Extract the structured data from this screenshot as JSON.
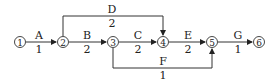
{
  "diagram": {
    "type": "activity-on-arrow network",
    "nodes": [
      {
        "id": "1",
        "label": "1",
        "x": 20,
        "y": 42
      },
      {
        "id": "2",
        "label": "2",
        "x": 63,
        "y": 42
      },
      {
        "id": "3",
        "label": "3",
        "x": 113,
        "y": 42
      },
      {
        "id": "4",
        "label": "4",
        "x": 163,
        "y": 42
      },
      {
        "id": "5",
        "label": "5",
        "x": 212,
        "y": 42
      },
      {
        "id": "6",
        "label": "6",
        "x": 259,
        "y": 42
      }
    ],
    "activities": [
      {
        "name": "A",
        "duration": "1",
        "from": "1",
        "to": "2"
      },
      {
        "name": "B",
        "duration": "2",
        "from": "2",
        "to": "3"
      },
      {
        "name": "C",
        "duration": "2",
        "from": "3",
        "to": "4"
      },
      {
        "name": "D",
        "duration": "2",
        "from": "2",
        "to": "4"
      },
      {
        "name": "E",
        "duration": "2",
        "from": "4",
        "to": "5"
      },
      {
        "name": "F",
        "duration": "1",
        "from": "3",
        "to": "5"
      },
      {
        "name": "G",
        "duration": "1",
        "from": "5",
        "to": "6"
      }
    ]
  }
}
